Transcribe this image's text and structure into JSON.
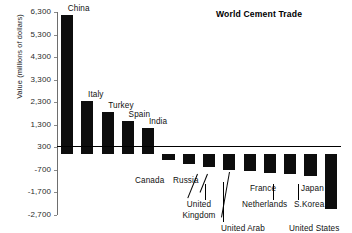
{
  "chart_data": {
    "type": "bar",
    "title": "World Cement Trade",
    "xlabel": "",
    "ylabel": "Value (millions of dollars)",
    "ylim": [
      -2700,
      6300
    ],
    "grid": false,
    "legend_position": "none",
    "ytick_labels": [
      "6,300",
      "5,300",
      "4,300",
      "3,300",
      "2,300",
      "1,300",
      "300",
      "-700",
      "-1,700",
      "-2,700"
    ],
    "ytick_values": [
      6300,
      5300,
      4300,
      3300,
      2300,
      1300,
      300,
      -700,
      -1700,
      -2700
    ],
    "categories": [
      "China",
      "Italy",
      "Turkey",
      "Spain",
      "India",
      "Canada",
      "Russia",
      "United Kingdom",
      "United Arab Emirates",
      "France",
      "Netherlands",
      "S.Korea",
      "Japan",
      "United States"
    ],
    "values": [
      6150,
      2350,
      1850,
      1450,
      1170,
      -250,
      -420,
      -560,
      -700,
      -760,
      -830,
      -900,
      -980,
      -2450
    ],
    "bar_color": "#0d0d0d"
  },
  "axis": {
    "ylabel": "Value (millions of dollars)"
  },
  "title": {
    "text": "World Cement Trade"
  },
  "positive_labels": [
    {
      "name": "China",
      "text": "China"
    },
    {
      "name": "Italy",
      "text": "Italy"
    },
    {
      "name": "Turkey",
      "text": "Turkey"
    },
    {
      "name": "Spain",
      "text": "Spain"
    },
    {
      "name": "India",
      "text": "India"
    }
  ],
  "negative_labels": [
    {
      "name": "Canada",
      "text": "Canada"
    },
    {
      "name": "Russia",
      "text": "Russia"
    },
    {
      "name": "United Kingdom",
      "text": "United Kingdom"
    },
    {
      "name": "United Arab Emirates",
      "text": "United Arab Emirates"
    },
    {
      "name": "France",
      "text": "France"
    },
    {
      "name": "Netherlands",
      "text": "Netherlands"
    },
    {
      "name": "S.Korea",
      "text": "S.Korea"
    },
    {
      "name": "Japan",
      "text": "Japan"
    },
    {
      "name": "United States",
      "text": "United States"
    }
  ]
}
